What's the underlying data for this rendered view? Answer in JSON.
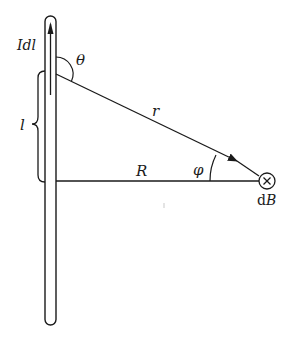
{
  "diagram": {
    "labels": {
      "current_element": "Idl",
      "theta": "θ",
      "length": "l",
      "r": "r",
      "R": "R",
      "phi": "φ",
      "field": "dB",
      "field_symbol": "×"
    },
    "colors": {
      "stroke": "#1a1a1a",
      "background": "#ffffff"
    }
  }
}
